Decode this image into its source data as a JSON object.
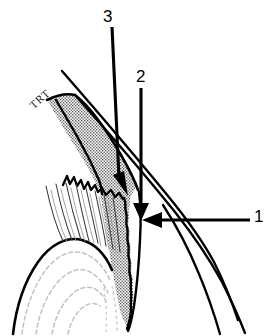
{
  "figure": {
    "title": "",
    "type": "line-art anatomical illustration",
    "background_color": "#ffffff",
    "ink_color": "#000000",
    "stipple_color": "#7d7d7d",
    "faint_line_color": "#bdbdbd"
  },
  "labels": {
    "one": "1",
    "two": "2",
    "three": "3",
    "trt": "TRT"
  },
  "callouts": [
    {
      "id": "callout-1",
      "label": "1",
      "direction": "left",
      "tail": {
        "x": 250,
        "y": 220
      },
      "tip": {
        "x": 141,
        "y": 220
      }
    },
    {
      "id": "callout-2",
      "label": "2",
      "direction": "down",
      "tail": {
        "x": 141,
        "y": 88
      },
      "tip": {
        "x": 141,
        "y": 218
      }
    },
    {
      "id": "callout-3",
      "label": "3",
      "direction": "down-left",
      "tail": {
        "x": 112,
        "y": 27
      },
      "tip": {
        "x": 124,
        "y": 194
      }
    }
  ],
  "annotations": [
    {
      "id": "trt-label",
      "text": "TRT",
      "rotation_degrees": -42
    }
  ]
}
